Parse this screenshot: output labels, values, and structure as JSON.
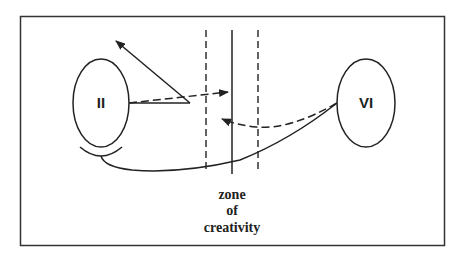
{
  "diagram": {
    "colors": {
      "stroke": "#222222",
      "background": "#ffffff"
    },
    "nodes": [
      {
        "id": "II",
        "label": "II"
      },
      {
        "id": "VI",
        "label": "VI"
      }
    ],
    "zone": {
      "lines": [
        "zone",
        "of",
        "creativity"
      ]
    },
    "connections": [
      {
        "from": "II",
        "to": "zone",
        "style": "dashed",
        "arrow": true
      },
      {
        "from": "II",
        "to": "up-left",
        "style": "solid",
        "arrow": true
      },
      {
        "from": "VI",
        "to": "zone",
        "style": "dashed",
        "arrow": true
      },
      {
        "from": "VI",
        "to": "II",
        "style": "solid",
        "arrow": false
      }
    ]
  }
}
